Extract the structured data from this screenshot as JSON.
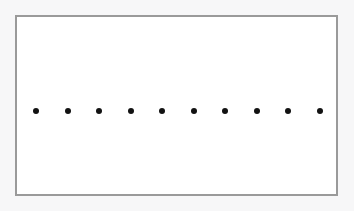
{
  "figure": {
    "title": "",
    "caption": "",
    "canvas": {
      "width": 354,
      "height": 211,
      "background_color": "#f7f7f8"
    },
    "frame": {
      "name": "plot-border-rectangle",
      "x": 15,
      "y": 15,
      "width": 323,
      "height": 181,
      "fill_color": "#ffffff",
      "border_color": "#9a9a9a",
      "border_width": 2
    },
    "marker_style": {
      "shape": "circle",
      "color": "#121212",
      "diameter": 6
    }
  },
  "chart_data": {
    "type": "scatter",
    "title": "",
    "xlabel": "",
    "ylabel": "",
    "grid": false,
    "legend": null,
    "axis_visible": false,
    "tick_labels": {
      "x": [],
      "y": []
    },
    "xlim": [
      0,
      9
    ],
    "ylim": [
      0,
      1
    ],
    "series": [
      {
        "name": "dots",
        "marker": "circle",
        "color": "#121212",
        "count": 10,
        "x": [
          0,
          1,
          2,
          3,
          4,
          5,
          6,
          7,
          8,
          9
        ],
        "y": [
          0.5,
          0.5,
          0.5,
          0.5,
          0.5,
          0.5,
          0.5,
          0.5,
          0.5,
          0.5
        ],
        "pixel_points": [
          {
            "cx": 34,
            "cy": 109
          },
          {
            "cx": 66,
            "cy": 109
          },
          {
            "cx": 97,
            "cy": 109
          },
          {
            "cx": 129,
            "cy": 109
          },
          {
            "cx": 160,
            "cy": 109
          },
          {
            "cx": 192,
            "cy": 109
          },
          {
            "cx": 223,
            "cy": 109
          },
          {
            "cx": 255,
            "cy": 109
          },
          {
            "cx": 286,
            "cy": 109
          },
          {
            "cx": 318,
            "cy": 109
          }
        ]
      }
    ],
    "annotations": []
  }
}
